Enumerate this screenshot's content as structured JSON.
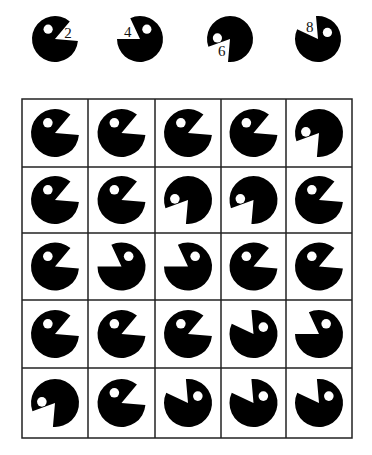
{
  "legend": [
    {
      "label": "2",
      "orientation": "right"
    },
    {
      "label": "4",
      "orientation": "upper-left"
    },
    {
      "label": "6",
      "orientation": "down-left"
    },
    {
      "label": "8",
      "orientation": "up-left-top"
    }
  ],
  "grid": {
    "rows": 5,
    "cols": 5,
    "cells": [
      [
        "right",
        "right",
        "right",
        "right",
        "down-left"
      ],
      [
        "right",
        "right",
        "down-left",
        "down-left",
        "right"
      ],
      [
        "right",
        "upper-left",
        "upper-left",
        "right",
        "right"
      ],
      [
        "right",
        "right",
        "right",
        "up-left-top",
        "upper-left"
      ],
      [
        "down-left",
        "right",
        "up-left-top",
        "up-left-top",
        "up-left-top"
      ]
    ]
  },
  "colors": {
    "shape": "#000000",
    "background": "#ffffff",
    "grid_line": "#222222"
  }
}
